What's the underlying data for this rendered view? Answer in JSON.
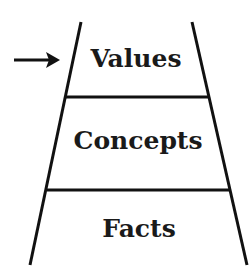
{
  "diagram": {
    "type": "ladder",
    "levels": [
      {
        "label": "Values",
        "position": "top",
        "highlighted": true
      },
      {
        "label": "Concepts",
        "position": "middle",
        "highlighted": false
      },
      {
        "label": "Facts",
        "position": "bottom",
        "highlighted": false
      }
    ],
    "pointer": {
      "icon": "right-arrow-icon",
      "points_to": "Values"
    },
    "colors": {
      "line": "#111111",
      "text": "#1a1a1a",
      "background": "#ffffff"
    }
  }
}
